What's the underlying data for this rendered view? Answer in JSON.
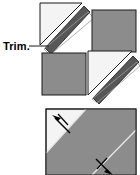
{
  "document": {
    "title": "Trim and press diagram",
    "background_color": "#ffffff"
  },
  "palette": {
    "light_fabric": "#f4f4f4",
    "dark_fabric": "#8c8c8c",
    "trim_strip": "#575757",
    "outline": "#1a1a1a",
    "seam_line": "#d8d8d8",
    "arrow": "#000000",
    "label_text": "#000000"
  },
  "figures": [
    {
      "id": "trim-figure",
      "name": "four-patch-trim-diagram",
      "caption": "",
      "annotation": {
        "label": "Trim.",
        "leader_from_x": 30,
        "leader_to_x": 49,
        "leader_y": 46
      },
      "blocks": [
        {
          "name": "block-top-left",
          "fabric": "light",
          "shape": "half-square-triangle",
          "has_trim_strip": true,
          "trim_position": "lower-right-diagonal"
        },
        {
          "name": "block-top-right",
          "fabric": "dark",
          "shape": "square",
          "has_trim_strip": false,
          "trim_position": ""
        },
        {
          "name": "block-bottom-left",
          "fabric": "dark",
          "shape": "square",
          "has_trim_strip": false,
          "trim_position": ""
        },
        {
          "name": "block-bottom-right",
          "fabric": "light",
          "shape": "half-square-triangle",
          "has_trim_strip": true,
          "trim_position": "lower-right-diagonal"
        }
      ]
    },
    {
      "id": "press-figure",
      "name": "seam-pressing-diagram",
      "caption": "",
      "block": {
        "name": "joined-block",
        "light_corner": "top-left",
        "dark_area": "lower-right",
        "seam": "diagonal"
      },
      "arrows": [
        {
          "name": "press-arrow-upper",
          "direction": "up-left",
          "meaning": "press seam toward upper left"
        },
        {
          "name": "press-arrow-lower",
          "direction": "down-right",
          "meaning": "press seam toward lower right"
        }
      ]
    }
  ]
}
